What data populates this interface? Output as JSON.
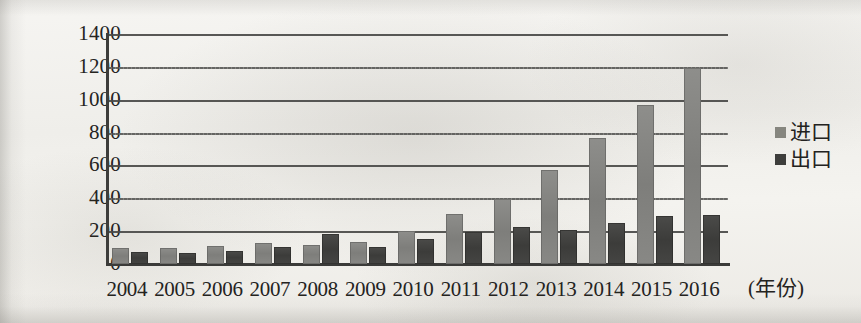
{
  "chart_data": {
    "type": "bar",
    "title": "",
    "subtitle": "",
    "xlabel": "(年份)",
    "ylabel": "",
    "ylim": [
      0,
      1400
    ],
    "ytick_step": 200,
    "yticks": [
      1400,
      1200,
      1000,
      800,
      600,
      400,
      200,
      0
    ],
    "ytick_labels": [
      "1400",
      "1200",
      "1000",
      "800",
      "600",
      "400",
      "200",
      "0"
    ],
    "grid": true,
    "grid_axis": "y",
    "legend_position": "right",
    "categories": [
      "2004",
      "2005",
      "2006",
      "2007",
      "2008",
      "2009",
      "2010",
      "2011",
      "2012",
      "2013",
      "2014",
      "2015",
      "2016"
    ],
    "series": [
      {
        "name": "进口",
        "color": "#84847d",
        "values": [
          95,
          100,
          110,
          130,
          115,
          135,
          200,
          305,
          395,
          575,
          765,
          965,
          1195
        ]
      },
      {
        "name": "出口",
        "color": "#3e3e3c",
        "values": [
          75,
          70,
          80,
          105,
          180,
          105,
          150,
          195,
          225,
          205,
          250,
          295,
          300
        ]
      }
    ],
    "annotations": []
  },
  "axis": {
    "y_tick_labels": [
      "1400",
      "1200",
      "1000",
      "800",
      "600",
      "400",
      "200",
      "0"
    ],
    "x_tick_labels": [
      "2004",
      "2005",
      "2006",
      "2007",
      "2008",
      "2009",
      "2010",
      "2011",
      "2012",
      "2013",
      "2014",
      "2015",
      "2016"
    ],
    "x_title": "(年份)"
  },
  "legend": {
    "items": [
      {
        "label": "进口",
        "swatch": "import-swatch"
      },
      {
        "label": "出口",
        "swatch": "export-swatch"
      }
    ]
  }
}
